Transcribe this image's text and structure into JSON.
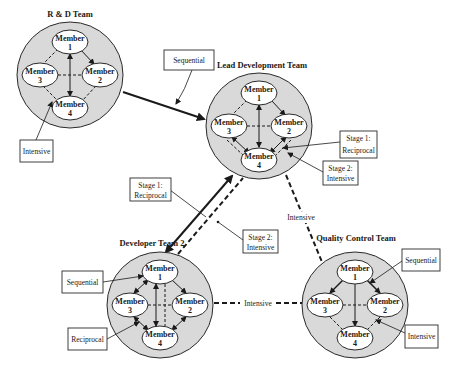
{
  "diagram": {
    "teams": [
      {
        "id": "rd",
        "title": "R & D Team",
        "members": [
          {
            "label": "Member",
            "num": "1"
          },
          {
            "label": "Member",
            "num": "2"
          },
          {
            "label": "Member",
            "num": "3"
          },
          {
            "label": "Member",
            "num": "4"
          }
        ]
      },
      {
        "id": "lead",
        "title": "Lead Development Team",
        "members": [
          {
            "label": "Member",
            "num": "1"
          },
          {
            "label": "Member",
            "num": "2"
          },
          {
            "label": "Member",
            "num": "3"
          },
          {
            "label": "Member",
            "num": "4"
          }
        ]
      },
      {
        "id": "dev2",
        "title": "Developer Team 2",
        "members": [
          {
            "label": "Member",
            "num": "1"
          },
          {
            "label": "Member",
            "num": "2"
          },
          {
            "label": "Member",
            "num": "3"
          },
          {
            "label": "Member",
            "num": "4"
          }
        ]
      },
      {
        "id": "qc",
        "title": "Quality Control Team",
        "members": [
          {
            "label": "Member",
            "num": "1"
          },
          {
            "label": "Member",
            "num": "2"
          },
          {
            "label": "Member",
            "num": "3"
          },
          {
            "label": "Member",
            "num": "4"
          }
        ]
      }
    ],
    "labels": {
      "rd_intensive": "Intensive",
      "rd_lead_sequential": "Sequential",
      "lead_stage1_a": "Stage 1:",
      "lead_stage1_b": "Reciprocal",
      "lead_stage2_a": "Stage 2:",
      "lead_stage2_b": "Intensive",
      "link_stage1_a": "Stage 1:",
      "link_stage1_b": "Reciprocal",
      "link_stage2_a": "Stage 2:",
      "link_stage2_b": "Intensive",
      "lead_qc_intensive": "Intensive",
      "dev2_qc_intensive": "Intensive",
      "dev2_sequential": "Sequential",
      "dev2_reciprocal": "Reciprocal",
      "qc_sequential": "Sequential",
      "qc_intensive": "Intensive"
    },
    "colors": {
      "circle_fill": "#d9d9d9",
      "line": "#1a1a1a",
      "ellipse_fill": "#ffffff"
    }
  }
}
